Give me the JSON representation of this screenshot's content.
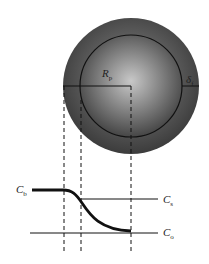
{
  "diagram": {
    "labels": {
      "particle_radius": {
        "main": "R",
        "sub": "p"
      },
      "film_thickness": {
        "main": "δ",
        "sub": "f"
      },
      "bulk_concentration": {
        "main": "C",
        "sub": "b"
      },
      "surface_concentration": {
        "main": "C",
        "sub": "s"
      },
      "center_concentration": {
        "main": "C",
        "sub": "o"
      }
    },
    "colors": {
      "outer_shell": "#4a4a4a",
      "inner_core_light": "#bdbdbd",
      "inner_core_dark": "#3a3a3a",
      "lines": "#111111"
    }
  }
}
